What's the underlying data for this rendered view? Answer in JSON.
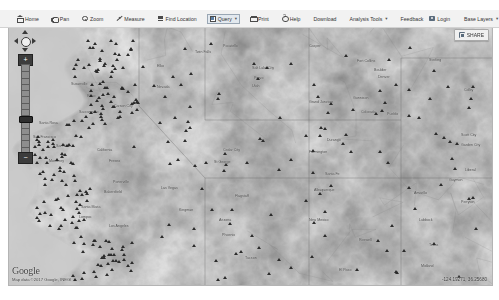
{
  "toolbar": {
    "items": [
      {
        "label": "Home",
        "icon": "home-icon",
        "active": false,
        "caret": ""
      },
      {
        "label": "Pan",
        "icon": "pan-icon",
        "active": false,
        "caret": ""
      },
      {
        "label": "Zoom",
        "icon": "zoom-icon",
        "active": false,
        "caret": ""
      },
      {
        "label": "Measure",
        "icon": "measure-icon",
        "active": false,
        "caret": ""
      },
      {
        "label": "Find Location",
        "icon": "find-location-icon",
        "active": false,
        "caret": ""
      },
      {
        "label": "Query",
        "icon": "query-icon",
        "active": true,
        "caret": "▾"
      },
      {
        "label": "Print",
        "icon": "print-icon",
        "active": false,
        "caret": ""
      },
      {
        "label": "Help",
        "icon": "help-icon",
        "active": false,
        "caret": ""
      },
      {
        "label": "Download",
        "icon": "",
        "active": false,
        "caret": ""
      },
      {
        "label": "Analysis Tools",
        "icon": "",
        "active": false,
        "caret": "▾"
      },
      {
        "label": "Feedback",
        "icon": "",
        "active": false,
        "caret": ""
      }
    ],
    "login_label": "Login",
    "login_icon": "login-icon",
    "base_layers_label": "Base Layers",
    "base_layers_caret": "▾"
  },
  "share": {
    "label": "SHARE",
    "icon": "share-icon"
  },
  "nav": {
    "zoom_in_label": "+",
    "zoom_out_label": "−",
    "pan_up_icon": "pan-up-arrow-icon",
    "pan_down_icon": "pan-down-arrow-icon",
    "pan_left_icon": "pan-left-arrow-icon",
    "pan_right_icon": "pan-right-arrow-icon",
    "tick_count": 14,
    "thumb_position_pct": 62
  },
  "attribution": {
    "brand": "Google",
    "map_data": "Map data ©2017 Google, INEGI"
  },
  "status": {
    "coordinates": "-124.19271, 36.25680"
  },
  "map": {
    "basemap_style": "grayscale-terrain",
    "labels": [
      {
        "t": "Fort Collins",
        "x": 348,
        "y": 31
      },
      {
        "t": "Boulder",
        "x": 365,
        "y": 40
      },
      {
        "t": "Denver",
        "x": 369,
        "y": 47
      },
      {
        "t": "Gunnison",
        "x": 344,
        "y": 68
      },
      {
        "t": "Nevada",
        "x": 148,
        "y": 57
      },
      {
        "t": "Utah",
        "x": 243,
        "y": 56
      },
      {
        "t": "Salt Lake City",
        "x": 243,
        "y": 38
      },
      {
        "t": "Reno",
        "x": 78,
        "y": 66
      },
      {
        "t": "Carson City",
        "x": 105,
        "y": 76
      },
      {
        "t": "Sacramento",
        "x": 70,
        "y": 82
      },
      {
        "t": "Santa Rosa",
        "x": 30,
        "y": 93
      },
      {
        "t": "San Francisco",
        "x": 24,
        "y": 107
      },
      {
        "t": "San Jose",
        "x": 47,
        "y": 116
      },
      {
        "t": "California",
        "x": 88,
        "y": 120
      },
      {
        "t": "Fresno",
        "x": 100,
        "y": 131
      },
      {
        "t": "Monterey",
        "x": 40,
        "y": 131
      },
      {
        "t": "Porterville",
        "x": 104,
        "y": 152
      },
      {
        "t": "Bakersfield",
        "x": 95,
        "y": 162
      },
      {
        "t": "Santa Maria",
        "x": 72,
        "y": 177
      },
      {
        "t": "Lompoc",
        "x": 70,
        "y": 187
      },
      {
        "t": "Los Angeles",
        "x": 100,
        "y": 196
      },
      {
        "t": "Las Vegas",
        "x": 152,
        "y": 158
      },
      {
        "t": "Arizona",
        "x": 210,
        "y": 190
      },
      {
        "t": "Phoenix",
        "x": 213,
        "y": 205
      },
      {
        "t": "Tucson",
        "x": 236,
        "y": 228
      },
      {
        "t": "New Mexico",
        "x": 300,
        "y": 190
      },
      {
        "t": "Albuquerque",
        "x": 305,
        "y": 160
      },
      {
        "t": "Santa Fe",
        "x": 316,
        "y": 144
      },
      {
        "t": "Colorado",
        "x": 352,
        "y": 82
      },
      {
        "t": "Pueblo",
        "x": 378,
        "y": 84
      },
      {
        "t": "Amarillo",
        "x": 405,
        "y": 163
      },
      {
        "t": "Lubbock",
        "x": 410,
        "y": 190
      },
      {
        "t": "Texas",
        "x": 420,
        "y": 215
      },
      {
        "t": "Colby",
        "x": 455,
        "y": 60
      },
      {
        "t": "Scott City",
        "x": 452,
        "y": 105
      },
      {
        "t": "Garden City",
        "x": 452,
        "y": 115
      },
      {
        "t": "Liberal",
        "x": 456,
        "y": 140
      },
      {
        "t": "Guymon",
        "x": 440,
        "y": 150
      },
      {
        "t": "Perryton",
        "x": 452,
        "y": 172
      },
      {
        "t": "Kingman",
        "x": 170,
        "y": 180
      },
      {
        "t": "Flagstaff",
        "x": 226,
        "y": 166
      },
      {
        "t": "Grand Junction",
        "x": 300,
        "y": 72
      },
      {
        "t": "Provo",
        "x": 245,
        "y": 48
      },
      {
        "t": "Elko",
        "x": 148,
        "y": 36
      },
      {
        "t": "Twin Falls",
        "x": 186,
        "y": 22
      },
      {
        "t": "Pocatello",
        "x": 214,
        "y": 16
      },
      {
        "t": "Cedar City",
        "x": 214,
        "y": 120
      },
      {
        "t": "St George",
        "x": 205,
        "y": 132
      },
      {
        "t": "Durango",
        "x": 318,
        "y": 110
      },
      {
        "t": "Farmington",
        "x": 300,
        "y": 122
      },
      {
        "t": "Roswell",
        "x": 350,
        "y": 210
      },
      {
        "t": "El Paso",
        "x": 330,
        "y": 240
      },
      {
        "t": "Midland",
        "x": 412,
        "y": 236
      },
      {
        "t": "Sterling",
        "x": 420,
        "y": 30
      },
      {
        "t": "Casper",
        "x": 300,
        "y": 16
      },
      {
        "t": "Susanville",
        "x": 62,
        "y": 54
      }
    ]
  }
}
